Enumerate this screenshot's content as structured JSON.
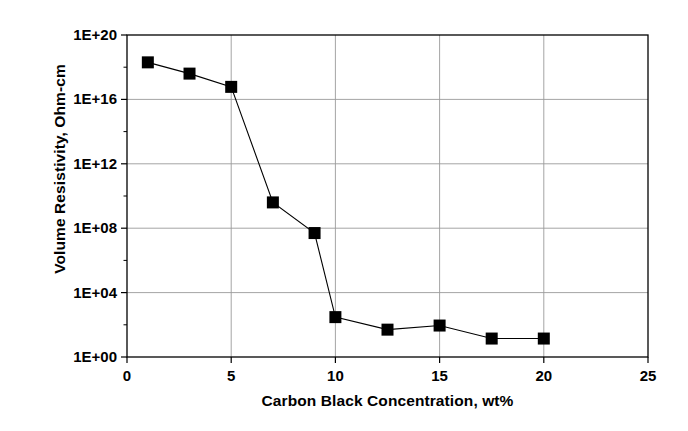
{
  "chart_data": {
    "type": "line",
    "title": "",
    "subtitle": "",
    "xlabel": "Carbon Black Concentration, wt%",
    "ylabel": "Volume Resistivity, Ohm-cm",
    "xlim": [
      0,
      25
    ],
    "ylim": [
      1.0,
      1e+20
    ],
    "yscale": "log",
    "xticks": [
      0,
      5,
      10,
      15,
      20,
      25
    ],
    "xtick_labels": [
      "0",
      "5",
      "10",
      "15",
      "20",
      "25"
    ],
    "yticks": [
      1.0,
      10000.0,
      100000000.0,
      1000000000000.0,
      1e+16,
      1e+20
    ],
    "ytick_labels": [
      "1E+00",
      "1E+04",
      "1E+08",
      "1E+12",
      "1E+16",
      "1E+20"
    ],
    "grid": true,
    "grid_axis": "y",
    "legend": false,
    "legend_position": "none",
    "marker": "square",
    "marker_color": "#000000",
    "line_color": "#000000",
    "x": [
      1,
      3,
      5,
      7,
      9,
      10,
      12.5,
      15,
      17.5,
      20
    ],
    "y": [
      2e+18,
      4e+17,
      6e+16,
      4000000000.0,
      50000000.0,
      300.0,
      50.0,
      90.0,
      14.0,
      14.0
    ],
    "series": [
      {
        "name": "Volume Resistivity",
        "points": [
          {
            "x": 1,
            "y": 2e+18
          },
          {
            "x": 3,
            "y": 4e+17
          },
          {
            "x": 5,
            "y": 6e+16
          },
          {
            "x": 7,
            "y": 4000000000.0
          },
          {
            "x": 9,
            "y": 50000000.0
          },
          {
            "x": 10,
            "y": 300.0
          },
          {
            "x": 12.5,
            "y": 50.0
          },
          {
            "x": 15,
            "y": 90.0
          },
          {
            "x": 17.5,
            "y": 14.0
          },
          {
            "x": 20,
            "y": 14.0
          }
        ]
      }
    ],
    "annotations": []
  },
  "axis_colors": {
    "frame": "#000000",
    "gridline": "#9a9a9a",
    "background": "#ffffff"
  }
}
